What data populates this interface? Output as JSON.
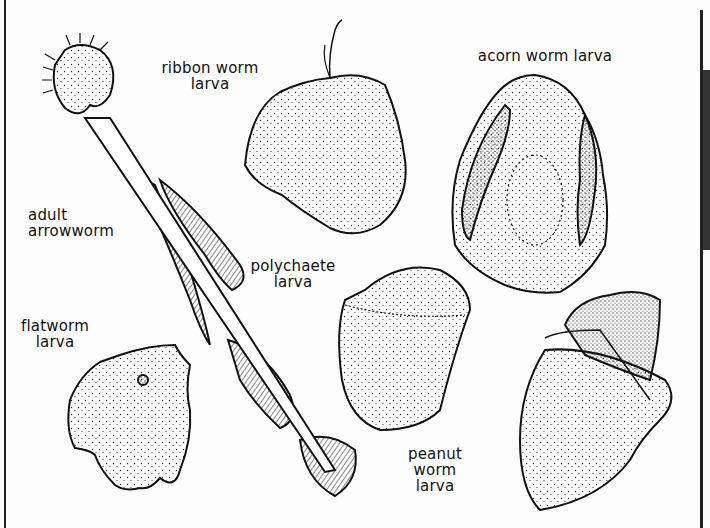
{
  "illustration": {
    "subject": "marine invertebrate larvae and adult arrowworm",
    "style": "pen-and-ink stippled line drawing",
    "ink_color": "#111111",
    "background_color": "#fdfdfd"
  },
  "labels": {
    "ribbon_worm": [
      "ribbon worm",
      "larva"
    ],
    "acorn_worm": [
      "acorn worm larva"
    ],
    "adult_arrowworm": [
      "adult",
      "arrowworm"
    ],
    "polychaete": [
      "polychaete",
      "larva"
    ],
    "flatworm": [
      "flatworm",
      "larva"
    ],
    "peanut_worm": [
      "peanut",
      "worm",
      "larva"
    ]
  }
}
